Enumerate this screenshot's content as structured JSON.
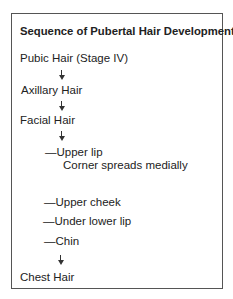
{
  "title": "Sequence of Pubertal Hair Development",
  "steps": [
    {
      "label": "Pubic Hair (Stage IV)"
    },
    {
      "label": "Axillary Hair"
    },
    {
      "label": "Facial Hair",
      "substeps": [
        {
          "label": "—Upper lip",
          "note": "Corner spreads medially"
        },
        {
          "label": "—Upper cheek"
        },
        {
          "label": "—Under lower lip"
        },
        {
          "label": "—Chin"
        }
      ]
    },
    {
      "label": "Chest Hair"
    }
  ],
  "colors": {
    "text": "#222222",
    "border": "#555555",
    "background": "#ffffff"
  }
}
